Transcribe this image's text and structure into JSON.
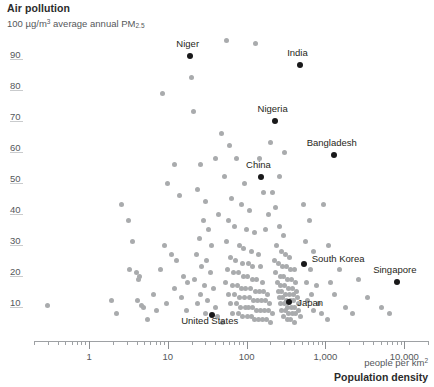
{
  "chart_data": {
    "type": "scatter",
    "title": "Air pollution",
    "subtitle_prefix": "100 µg/m",
    "subtitle_sup": "3",
    "subtitle_mid": " average annual PM",
    "subtitle_sub": "2.5",
    "xlabel": "Population density",
    "xlabel_unit_prefix": "people per km",
    "xlabel_unit_sup": "2",
    "ylabel": "Air pollution",
    "x_scale": "log",
    "y_scale": "linear",
    "xlim": [
      0.2,
      20000
    ],
    "ylim": [
      0,
      100
    ],
    "grid": "horizontal-ticks-only",
    "legend": "none",
    "xticks": [
      "1",
      "10",
      "100",
      "1,000",
      "10,000"
    ],
    "xtick_values": [
      1,
      10,
      100,
      1000,
      10000
    ],
    "yticks": [
      "10",
      "20",
      "30",
      "40",
      "50",
      "60",
      "70",
      "80",
      "90"
    ],
    "ytick_values": [
      10,
      20,
      30,
      40,
      50,
      60,
      70,
      80,
      90
    ],
    "highlighted": [
      {
        "name": "Niger",
        "x": 19,
        "y": 91,
        "label_dx": -2,
        "label_dy": -12,
        "align": "center"
      },
      {
        "name": "India",
        "x": 470,
        "y": 88,
        "label_dx": -2,
        "label_dy": -12,
        "align": "center"
      },
      {
        "name": "Nigeria",
        "x": 226,
        "y": 70,
        "label_dx": -2,
        "label_dy": -12,
        "align": "center"
      },
      {
        "name": "Bangladesh",
        "x": 1270,
        "y": 59,
        "label_dx": -2,
        "label_dy": -12,
        "align": "center"
      },
      {
        "name": "China",
        "x": 150,
        "y": 52,
        "label_dx": -2,
        "label_dy": -12,
        "align": "center"
      },
      {
        "name": "South Korea",
        "x": 530,
        "y": 24,
        "label_dx": 8,
        "label_dy": -5,
        "align": "left"
      },
      {
        "name": "Singapore",
        "x": 8000,
        "y": 18,
        "label_dx": -2,
        "label_dy": -12,
        "align": "center"
      },
      {
        "name": "Japan",
        "x": 347,
        "y": 11.5,
        "label_dx": 8,
        "label_dy": 1,
        "align": "left"
      },
      {
        "name": "United States",
        "x": 36,
        "y": 7.5,
        "label_dx": -2,
        "label_dy": 6,
        "align": "center"
      }
    ],
    "points": [
      {
        "x": 0.3,
        "y": 10.5
      },
      {
        "x": 2.6,
        "y": 43
      },
      {
        "x": 3.2,
        "y": 38
      },
      {
        "x": 3.6,
        "y": 31
      },
      {
        "x": 3.3,
        "y": 22
      },
      {
        "x": 4.0,
        "y": 21
      },
      {
        "x": 4.4,
        "y": 20
      },
      {
        "x": 4.2,
        "y": 19
      },
      {
        "x": 4.1,
        "y": 12
      },
      {
        "x": 4.6,
        "y": 10.5
      },
      {
        "x": 4.9,
        "y": 10
      },
      {
        "x": 1.9,
        "y": 12
      },
      {
        "x": 8.5,
        "y": 79
      },
      {
        "x": 12,
        "y": 56
      },
      {
        "x": 10,
        "y": 50
      },
      {
        "x": 14,
        "y": 46
      },
      {
        "x": 9,
        "y": 30
      },
      {
        "x": 11,
        "y": 27
      },
      {
        "x": 13,
        "y": 25
      },
      {
        "x": 8,
        "y": 22
      },
      {
        "x": 16,
        "y": 20
      },
      {
        "x": 18,
        "y": 18
      },
      {
        "x": 12,
        "y": 16
      },
      {
        "x": 15,
        "y": 13
      },
      {
        "x": 9.5,
        "y": 11
      },
      {
        "x": 17,
        "y": 9
      },
      {
        "x": 20,
        "y": 84
      },
      {
        "x": 21,
        "y": 73
      },
      {
        "x": 26,
        "y": 56
      },
      {
        "x": 24,
        "y": 48
      },
      {
        "x": 30,
        "y": 44
      },
      {
        "x": 28,
        "y": 38
      },
      {
        "x": 33,
        "y": 35
      },
      {
        "x": 25,
        "y": 32
      },
      {
        "x": 36,
        "y": 30
      },
      {
        "x": 23,
        "y": 27
      },
      {
        "x": 31,
        "y": 25
      },
      {
        "x": 27,
        "y": 23
      },
      {
        "x": 35,
        "y": 21
      },
      {
        "x": 22,
        "y": 19
      },
      {
        "x": 29,
        "y": 17
      },
      {
        "x": 38,
        "y": 16
      },
      {
        "x": 26,
        "y": 14
      },
      {
        "x": 32,
        "y": 12
      },
      {
        "x": 24,
        "y": 11
      },
      {
        "x": 40,
        "y": 10
      },
      {
        "x": 30,
        "y": 8
      },
      {
        "x": 43,
        "y": 7
      },
      {
        "x": 55,
        "y": 96
      },
      {
        "x": 130,
        "y": 95
      },
      {
        "x": 60,
        "y": 62
      },
      {
        "x": 75,
        "y": 58
      },
      {
        "x": 52,
        "y": 52
      },
      {
        "x": 95,
        "y": 50
      },
      {
        "x": 64,
        "y": 45
      },
      {
        "x": 85,
        "y": 43
      },
      {
        "x": 110,
        "y": 41
      },
      {
        "x": 58,
        "y": 38
      },
      {
        "x": 70,
        "y": 36
      },
      {
        "x": 100,
        "y": 35
      },
      {
        "x": 125,
        "y": 34
      },
      {
        "x": 55,
        "y": 31
      },
      {
        "x": 80,
        "y": 30
      },
      {
        "x": 92,
        "y": 29
      },
      {
        "x": 115,
        "y": 28
      },
      {
        "x": 140,
        "y": 27
      },
      {
        "x": 62,
        "y": 26
      },
      {
        "x": 73,
        "y": 25
      },
      {
        "x": 88,
        "y": 24
      },
      {
        "x": 105,
        "y": 24
      },
      {
        "x": 120,
        "y": 23
      },
      {
        "x": 150,
        "y": 23
      },
      {
        "x": 57,
        "y": 22
      },
      {
        "x": 68,
        "y": 21
      },
      {
        "x": 78,
        "y": 21
      },
      {
        "x": 90,
        "y": 20
      },
      {
        "x": 103,
        "y": 20
      },
      {
        "x": 118,
        "y": 19
      },
      {
        "x": 135,
        "y": 19
      },
      {
        "x": 160,
        "y": 18
      },
      {
        "x": 54,
        "y": 18
      },
      {
        "x": 66,
        "y": 17
      },
      {
        "x": 76,
        "y": 17
      },
      {
        "x": 86,
        "y": 16
      },
      {
        "x": 98,
        "y": 16
      },
      {
        "x": 112,
        "y": 16
      },
      {
        "x": 128,
        "y": 15
      },
      {
        "x": 145,
        "y": 15
      },
      {
        "x": 165,
        "y": 15
      },
      {
        "x": 185,
        "y": 14
      },
      {
        "x": 59,
        "y": 14
      },
      {
        "x": 71,
        "y": 14
      },
      {
        "x": 82,
        "y": 13
      },
      {
        "x": 94,
        "y": 13
      },
      {
        "x": 108,
        "y": 13
      },
      {
        "x": 122,
        "y": 12
      },
      {
        "x": 138,
        "y": 12
      },
      {
        "x": 155,
        "y": 12
      },
      {
        "x": 175,
        "y": 12
      },
      {
        "x": 195,
        "y": 11
      },
      {
        "x": 63,
        "y": 11
      },
      {
        "x": 74,
        "y": 11
      },
      {
        "x": 84,
        "y": 10
      },
      {
        "x": 96,
        "y": 10
      },
      {
        "x": 107,
        "y": 10
      },
      {
        "x": 119,
        "y": 10
      },
      {
        "x": 133,
        "y": 9
      },
      {
        "x": 148,
        "y": 9
      },
      {
        "x": 168,
        "y": 9
      },
      {
        "x": 188,
        "y": 9
      },
      {
        "x": 210,
        "y": 8
      },
      {
        "x": 67,
        "y": 8
      },
      {
        "x": 79,
        "y": 8
      },
      {
        "x": 89,
        "y": 7
      },
      {
        "x": 101,
        "y": 7
      },
      {
        "x": 114,
        "y": 7
      },
      {
        "x": 127,
        "y": 6
      },
      {
        "x": 143,
        "y": 6
      },
      {
        "x": 158,
        "y": 6
      },
      {
        "x": 178,
        "y": 6
      },
      {
        "x": 200,
        "y": 5
      },
      {
        "x": 50,
        "y": 5
      },
      {
        "x": 230,
        "y": 42
      },
      {
        "x": 260,
        "y": 36
      },
      {
        "x": 290,
        "y": 33
      },
      {
        "x": 240,
        "y": 30
      },
      {
        "x": 275,
        "y": 28
      },
      {
        "x": 310,
        "y": 27
      },
      {
        "x": 345,
        "y": 26
      },
      {
        "x": 225,
        "y": 25
      },
      {
        "x": 255,
        "y": 24
      },
      {
        "x": 285,
        "y": 23
      },
      {
        "x": 320,
        "y": 23
      },
      {
        "x": 360,
        "y": 22
      },
      {
        "x": 400,
        "y": 22
      },
      {
        "x": 235,
        "y": 21
      },
      {
        "x": 265,
        "y": 20
      },
      {
        "x": 295,
        "y": 20
      },
      {
        "x": 330,
        "y": 19
      },
      {
        "x": 370,
        "y": 19
      },
      {
        "x": 415,
        "y": 18
      },
      {
        "x": 245,
        "y": 18
      },
      {
        "x": 272,
        "y": 17
      },
      {
        "x": 302,
        "y": 17
      },
      {
        "x": 338,
        "y": 16
      },
      {
        "x": 378,
        "y": 16
      },
      {
        "x": 425,
        "y": 15
      },
      {
        "x": 250,
        "y": 15
      },
      {
        "x": 280,
        "y": 15
      },
      {
        "x": 312,
        "y": 14
      },
      {
        "x": 350,
        "y": 14
      },
      {
        "x": 390,
        "y": 14
      },
      {
        "x": 440,
        "y": 13
      },
      {
        "x": 258,
        "y": 13
      },
      {
        "x": 288,
        "y": 13
      },
      {
        "x": 322,
        "y": 12
      },
      {
        "x": 358,
        "y": 12
      },
      {
        "x": 398,
        "y": 12
      },
      {
        "x": 450,
        "y": 11
      },
      {
        "x": 268,
        "y": 11
      },
      {
        "x": 298,
        "y": 11
      },
      {
        "x": 332,
        "y": 10
      },
      {
        "x": 368,
        "y": 10
      },
      {
        "x": 408,
        "y": 10
      },
      {
        "x": 460,
        "y": 9
      },
      {
        "x": 278,
        "y": 9
      },
      {
        "x": 308,
        "y": 9
      },
      {
        "x": 342,
        "y": 8
      },
      {
        "x": 380,
        "y": 8
      },
      {
        "x": 420,
        "y": 8
      },
      {
        "x": 475,
        "y": 7
      },
      {
        "x": 292,
        "y": 7
      },
      {
        "x": 325,
        "y": 6
      },
      {
        "x": 362,
        "y": 6
      },
      {
        "x": 405,
        "y": 5
      },
      {
        "x": 520,
        "y": 43
      },
      {
        "x": 620,
        "y": 38
      },
      {
        "x": 560,
        "y": 31
      },
      {
        "x": 700,
        "y": 28
      },
      {
        "x": 640,
        "y": 22
      },
      {
        "x": 580,
        "y": 18
      },
      {
        "x": 760,
        "y": 17
      },
      {
        "x": 660,
        "y": 14
      },
      {
        "x": 600,
        "y": 12
      },
      {
        "x": 820,
        "y": 11
      },
      {
        "x": 700,
        "y": 9
      },
      {
        "x": 900,
        "y": 8
      },
      {
        "x": 1100,
        "y": 30
      },
      {
        "x": 1500,
        "y": 22
      },
      {
        "x": 1300,
        "y": 14
      },
      {
        "x": 1800,
        "y": 10
      },
      {
        "x": 2600,
        "y": 19
      },
      {
        "x": 3400,
        "y": 13
      },
      {
        "x": 5200,
        "y": 10
      },
      {
        "x": 6500,
        "y": 8
      },
      {
        "x": 2200,
        "y": 8
      },
      {
        "x": 1050,
        "y": 6
      },
      {
        "x": 200,
        "y": 63
      },
      {
        "x": 300,
        "y": 60
      },
      {
        "x": 165,
        "y": 47
      },
      {
        "x": 190,
        "y": 40
      },
      {
        "x": 145,
        "y": 58
      },
      {
        "x": 260,
        "y": 52
      },
      {
        "x": 210,
        "y": 47
      },
      {
        "x": 175,
        "y": 35
      },
      {
        "x": 48,
        "y": 66
      },
      {
        "x": 40,
        "y": 58
      },
      {
        "x": 44,
        "y": 40
      },
      {
        "x": 6.5,
        "y": 14
      },
      {
        "x": 7.2,
        "y": 9
      },
      {
        "x": 5.5,
        "y": 6
      },
      {
        "x": 2.2,
        "y": 8
      },
      {
        "x": 950,
        "y": 43
      },
      {
        "x": 1150,
        "y": 18
      }
    ]
  }
}
